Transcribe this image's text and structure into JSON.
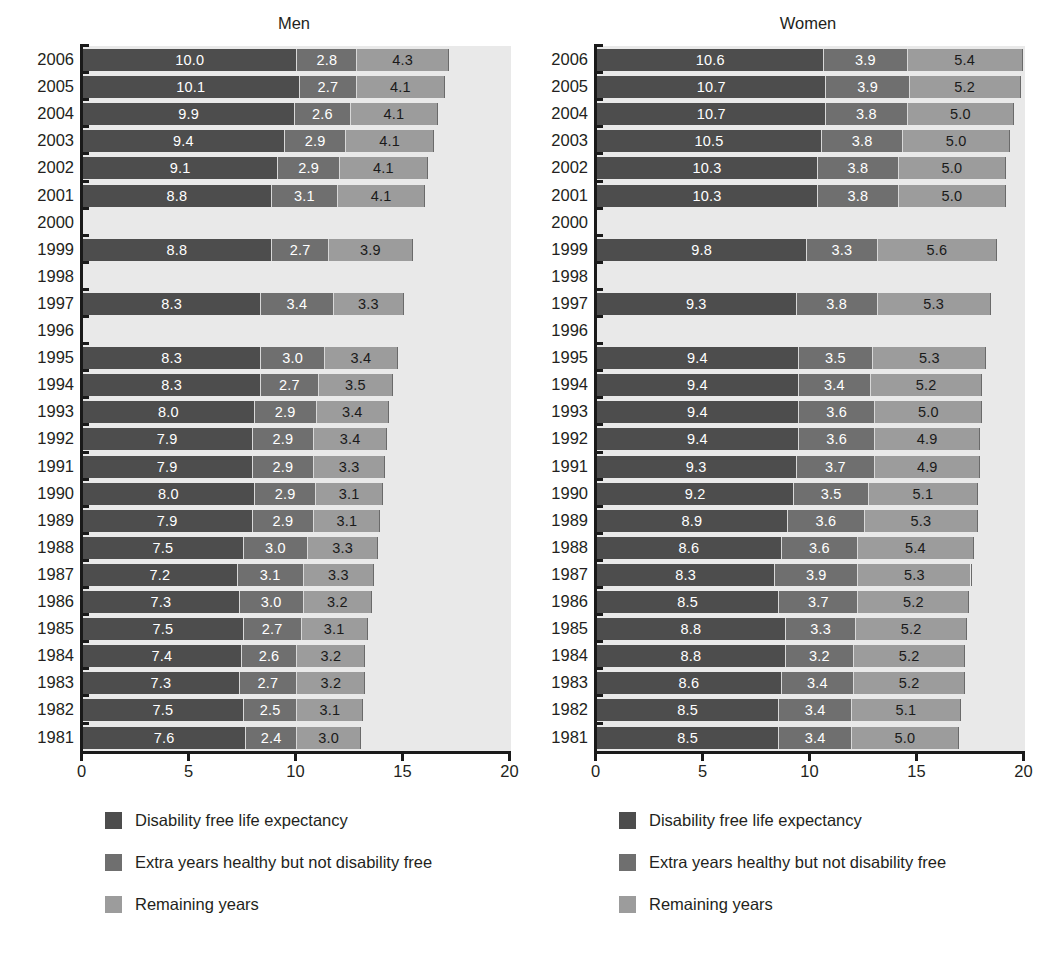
{
  "chart_data": {
    "type": "bar",
    "subtype": "horizontal-stacked",
    "title": "",
    "panels": [
      {
        "label": "Men",
        "xlabel": "",
        "ylabel": "",
        "xlim": [
          0,
          20
        ],
        "grid": false
      },
      {
        "label": "Women",
        "xlabel": "",
        "ylabel": "",
        "xlim": [
          0,
          20
        ],
        "grid": false
      }
    ],
    "xticks": [
      "0",
      "5",
      "10",
      "15",
      "20"
    ],
    "xtick_values": [
      0,
      5,
      10,
      15,
      20
    ],
    "categories": [
      "2006",
      "2005",
      "2004",
      "2003",
      "2002",
      "2001",
      "2000",
      "1999",
      "1998",
      "1997",
      "1996",
      "1995",
      "1994",
      "1993",
      "1992",
      "1991",
      "1990",
      "1989",
      "1988",
      "1987",
      "1986",
      "1985",
      "1984",
      "1983",
      "1982",
      "1981"
    ],
    "series_names": [
      "Disability free life expectancy",
      "Extra years healthy but not disability free",
      "Remaining years"
    ],
    "series_colors": [
      "#4d4d4d",
      "#6f6f6f",
      "#9c9c9c"
    ],
    "men": {
      "series": [
        {
          "name": "Disability free life expectancy",
          "values": [
            10.0,
            10.1,
            9.9,
            9.4,
            9.1,
            8.8,
            null,
            8.8,
            null,
            8.3,
            null,
            8.3,
            8.3,
            8.0,
            7.9,
            7.9,
            8.0,
            7.9,
            7.5,
            7.2,
            7.3,
            7.5,
            7.4,
            7.3,
            7.5,
            7.6
          ]
        },
        {
          "name": "Extra years healthy but not disability free",
          "values": [
            2.8,
            2.7,
            2.6,
            2.9,
            2.9,
            3.1,
            null,
            2.7,
            null,
            3.4,
            null,
            3.0,
            2.7,
            2.9,
            2.9,
            2.9,
            2.9,
            2.9,
            3.0,
            3.1,
            3.0,
            2.7,
            2.6,
            2.7,
            2.5,
            2.4
          ]
        },
        {
          "name": "Remaining years",
          "values": [
            4.3,
            4.1,
            4.1,
            4.1,
            4.1,
            4.1,
            null,
            3.9,
            null,
            3.3,
            null,
            3.4,
            3.5,
            3.4,
            3.4,
            3.3,
            3.1,
            3.1,
            3.3,
            3.3,
            3.2,
            3.1,
            3.2,
            3.2,
            3.1,
            3.0
          ]
        }
      ],
      "labels": [
        [
          "10.0",
          "10.1",
          "9.9",
          "9.4",
          "9.1",
          "8.8",
          "",
          "8.8",
          "",
          "8.3",
          "",
          "8.3",
          "8.3",
          "8.0",
          "7.9",
          "7.9",
          "8.0",
          "7.9",
          "7.5",
          "7.2",
          "7.3",
          "7.5",
          "7.4",
          "7.3",
          "7.5",
          "7.6"
        ],
        [
          "2.8",
          "2.7",
          "2.6",
          "2.9",
          "2.9",
          "3.1",
          "",
          "2.7",
          "",
          "3.4",
          "",
          "3.0",
          "2.7",
          "2.9",
          "2.9",
          "2.9",
          "2.9",
          "2.9",
          "3.0",
          "3.1",
          "3.0",
          "2.7",
          "2.6",
          "2.7",
          "2.5",
          "2.4"
        ],
        [
          "4.3",
          "4.1",
          "4.1",
          "4.1",
          "4.1",
          "4.1",
          "",
          "3.9",
          "",
          "3.3",
          "",
          "3.4",
          "3.5",
          "3.4",
          "3.4",
          "3.3",
          "3.1",
          "3.1",
          "3.3",
          "3.3",
          "3.2",
          "3.1",
          "3.2",
          "3.2",
          "3.1",
          "3.0"
        ]
      ]
    },
    "women": {
      "series": [
        {
          "name": "Disability free life expectancy",
          "values": [
            10.6,
            10.7,
            10.7,
            10.5,
            10.3,
            10.3,
            null,
            9.8,
            null,
            9.3,
            null,
            9.4,
            9.4,
            9.4,
            9.4,
            9.3,
            9.2,
            8.9,
            8.6,
            8.3,
            8.5,
            8.8,
            8.8,
            8.6,
            8.5,
            8.5
          ]
        },
        {
          "name": "Extra years healthy but not disability free",
          "values": [
            3.9,
            3.9,
            3.8,
            3.8,
            3.8,
            3.8,
            null,
            3.3,
            null,
            3.8,
            null,
            3.5,
            3.4,
            3.6,
            3.6,
            3.7,
            3.5,
            3.6,
            3.6,
            3.9,
            3.7,
            3.3,
            3.2,
            3.4,
            3.4,
            3.4
          ]
        },
        {
          "name": "Remaining years",
          "values": [
            5.4,
            5.2,
            5.0,
            5.0,
            5.0,
            5.0,
            null,
            5.6,
            null,
            5.3,
            null,
            5.3,
            5.2,
            5.0,
            4.9,
            4.9,
            5.1,
            5.3,
            5.4,
            5.3,
            5.2,
            5.2,
            5.2,
            5.2,
            5.1,
            5.0
          ]
        }
      ],
      "labels": [
        [
          "10.6",
          "10.7",
          "10.7",
          "10.5",
          "10.3",
          "10.3",
          "",
          "9.8",
          "",
          "9.3",
          "",
          "9.4",
          "9.4",
          "9.4",
          "9.4",
          "9.3",
          "9.2",
          "8.9",
          "8.6",
          "8.3",
          "8.5",
          "8.8",
          "8.8",
          "8.6",
          "8.5",
          "8.5"
        ],
        [
          "3.9",
          "3.9",
          "3.8",
          "3.8",
          "3.8",
          "3.8",
          "",
          "3.3",
          "",
          "3.8",
          "",
          "3.5",
          "3.4",
          "3.6",
          "3.6",
          "3.7",
          "3.5",
          "3.6",
          "3.6",
          "3.9",
          "3.7",
          "3.3",
          "3.2",
          "3.4",
          "3.4",
          "3.4"
        ],
        [
          "5.4",
          "5.2",
          "5.0",
          "5.0",
          "5.0",
          "5.0",
          "",
          "5.6",
          "",
          "5.3",
          "",
          "5.3",
          "5.2",
          "5.0",
          "4.9",
          "4.9",
          "5.1",
          "5.3",
          "5.4",
          "5.3",
          "5.2",
          "5.2",
          "5.2",
          "5.2",
          "5.1",
          "5.0"
        ]
      ]
    },
    "legend": {
      "position": "below",
      "entries": [
        {
          "label": "Disability free life expectancy",
          "color": "#4d4d4d"
        },
        {
          "label": "Extra years healthy but not disability free",
          "color": "#6f6f6f"
        },
        {
          "label": "Remaining years",
          "color": "#9c9c9c"
        }
      ]
    }
  }
}
